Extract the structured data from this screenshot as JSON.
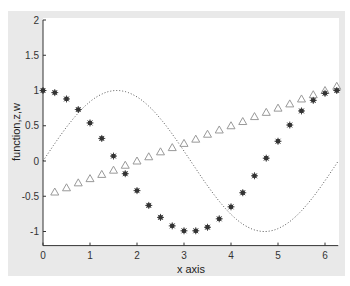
{
  "chart_data": {
    "type": "line",
    "title": "",
    "xlabel": "x axis",
    "ylabel": "function,z,w",
    "xlim": [
      0,
      6.2832
    ],
    "ylim": [
      -1.2,
      2
    ],
    "xticks": [
      0,
      1,
      2,
      3,
      4,
      5,
      6
    ],
    "yticks": [
      -1,
      -0.5,
      0,
      0.5,
      1,
      1.5,
      2
    ],
    "ytick_labels": [
      "-1",
      "-0.5",
      "0",
      "0.5",
      "1",
      "1.5",
      "2"
    ],
    "grid": false,
    "legend": null,
    "series": [
      {
        "name": "function",
        "style": "dotted-line",
        "formula": "sin(x)",
        "x": [
          0,
          0.5,
          1,
          1.5,
          2,
          2.5,
          3,
          3.5,
          4,
          4.5,
          5,
          5.5,
          6,
          6.2832
        ],
        "values": [
          0,
          0.48,
          0.84,
          1.0,
          0.91,
          0.6,
          0.14,
          -0.35,
          -0.76,
          -0.98,
          -0.96,
          -0.71,
          -0.28,
          0
        ]
      },
      {
        "name": "z",
        "style": "star-markers",
        "formula": "cos(x)",
        "x": [
          0,
          0.25,
          0.5,
          0.75,
          1,
          1.25,
          1.5,
          1.75,
          2,
          2.25,
          2.5,
          2.75,
          3,
          3.25,
          3.5,
          3.75,
          4,
          4.25,
          4.5,
          4.75,
          5,
          5.25,
          5.5,
          5.75,
          6,
          6.25
        ],
        "values": [
          1,
          0.97,
          0.88,
          0.73,
          0.54,
          0.32,
          0.07,
          -0.18,
          -0.42,
          -0.63,
          -0.8,
          -0.92,
          -0.99,
          -0.99,
          -0.94,
          -0.82,
          -0.65,
          -0.45,
          -0.21,
          0.04,
          0.28,
          0.51,
          0.71,
          0.86,
          0.96,
          1.0
        ]
      },
      {
        "name": "w",
        "style": "triangle-markers",
        "formula": "x/4 - 0.5",
        "x": [
          0.25,
          0.5,
          0.75,
          1,
          1.25,
          1.5,
          1.75,
          2,
          2.25,
          2.5,
          2.75,
          3,
          3.25,
          3.5,
          3.75,
          4,
          4.25,
          4.5,
          4.75,
          5,
          5.25,
          5.5,
          5.75,
          6,
          6.25
        ],
        "values": [
          -0.44,
          -0.38,
          -0.31,
          -0.25,
          -0.19,
          -0.13,
          -0.06,
          0,
          0.06,
          0.13,
          0.19,
          0.25,
          0.31,
          0.38,
          0.44,
          0.5,
          0.56,
          0.63,
          0.69,
          0.75,
          0.81,
          0.88,
          0.94,
          1.0,
          1.06
        ]
      }
    ]
  },
  "colors": {
    "frame_bg": "#e9e9e9",
    "plot_bg": "#ffffff",
    "axis": "#333333",
    "star": "#333333",
    "triangle": "#999999",
    "curve": "#555555"
  }
}
